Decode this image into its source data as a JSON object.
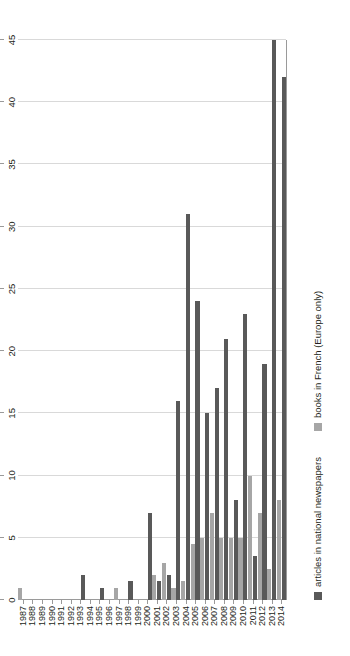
{
  "chart_data": {
    "type": "bar",
    "orientation": "vertical",
    "title": "",
    "subtitle": "",
    "xlabel": "",
    "ylabel": "",
    "ylim": [
      0,
      45
    ],
    "ytick_step": 5,
    "yticks": [
      "0",
      "5",
      "10",
      "15",
      "20",
      "25",
      "30",
      "35",
      "40",
      "45"
    ],
    "grid": true,
    "legend_position": "bottom-left",
    "categories": [
      "1987",
      "1988",
      "1989",
      "1990",
      "1991",
      "1992",
      "1993",
      "1994",
      "1995",
      "1996",
      "1997",
      "1998",
      "1999",
      "2000",
      "2001",
      "2002",
      "2003",
      "2004",
      "2005",
      "2006",
      "2007",
      "2008",
      "2009",
      "2010",
      "2011",
      "2012",
      "2013",
      "2014"
    ],
    "series": [
      {
        "name": "articles in national newspapers",
        "color": "#595959",
        "values": [
          0,
          0,
          0,
          0,
          0,
          0,
          2,
          0,
          1,
          0,
          0,
          1.5,
          0,
          7,
          1.5,
          2,
          16,
          31,
          24,
          15,
          17,
          21,
          8,
          23,
          3.5,
          19,
          45,
          42
        ]
      },
      {
        "name": "books in French (Europe only)",
        "color": "#a6a6a6",
        "values": [
          1,
          0,
          0,
          0,
          0,
          0,
          0,
          0,
          0,
          0,
          1,
          0,
          0,
          0,
          2,
          3,
          1,
          1.5,
          4.5,
          5,
          7,
          5,
          5,
          5,
          10,
          7,
          2.5,
          8
        ]
      }
    ]
  },
  "legend": {
    "items": [
      {
        "label": "articles in national newspapers",
        "swatch": "articles-swatch"
      },
      {
        "label": "books in French (Europe only)",
        "swatch": "books-swatch"
      }
    ]
  }
}
